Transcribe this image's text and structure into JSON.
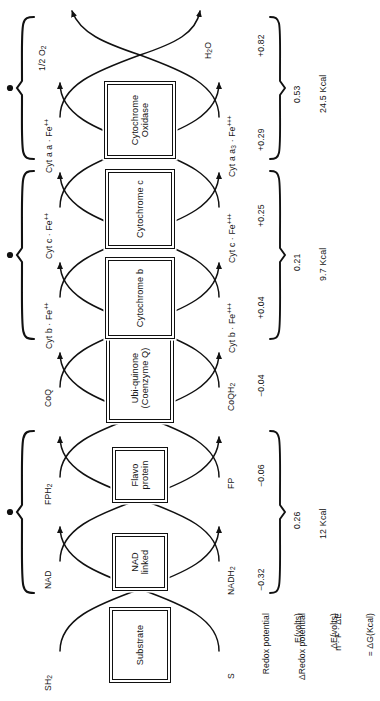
{
  "figure": {
    "orientation": "rotated-90-ccw"
  },
  "carriers": [
    {
      "id": "substrate",
      "line1": "Substrate",
      "line2": ""
    },
    {
      "id": "nad",
      "line1": "NAD",
      "line2": "linked"
    },
    {
      "id": "flavoprotein",
      "line1": "Flavo",
      "line2": "protein"
    },
    {
      "id": "ubiquinone",
      "line1": "Ubi-quinone",
      "line2": "(Coenzyme Q)"
    },
    {
      "id": "cyt-b",
      "line1": "Cytochrome b",
      "line2": ""
    },
    {
      "id": "cyt-c",
      "line1": "Cytochrome c",
      "line2": ""
    },
    {
      "id": "cyt-oxidase",
      "line1": "Cytochrome",
      "line2": "Oxidase"
    }
  ],
  "reduced_labels": [
    {
      "id": "sh2",
      "text": "SH2"
    },
    {
      "id": "nad-ox",
      "text": "NAD"
    },
    {
      "id": "fph2",
      "text": "FPH2"
    },
    {
      "id": "coq",
      "text": "CoQ"
    },
    {
      "id": "cyt-b-fe2",
      "text": "Cyt b · Fe++"
    },
    {
      "id": "cyt-c-fe2",
      "text": "Cyt c · Fe++"
    },
    {
      "id": "cyt-aa-fe2",
      "text": "Cyt a a · Fe++"
    },
    {
      "id": "half-o2",
      "text": "1/2 O2"
    }
  ],
  "oxidized_labels": [
    {
      "id": "s",
      "text": "S"
    },
    {
      "id": "nadh2",
      "text": "NADH2"
    },
    {
      "id": "fp",
      "text": "FP"
    },
    {
      "id": "coqh2",
      "text": "CoQH2"
    },
    {
      "id": "cyt-b-fe3",
      "text": "Cyt b · Fe+++"
    },
    {
      "id": "cyt-c-fe3",
      "text": "Cyt c · Fe+++"
    },
    {
      "id": "cyt-aa3-fe3",
      "text": "Cyt a a3 · Fe+++"
    },
    {
      "id": "h2o",
      "text": "H2O"
    }
  ],
  "atp_couplings": [
    {
      "id": "site-1",
      "text": "ADP + Pi → ATP"
    },
    {
      "id": "site-2",
      "text": "ADP + Pi → ATP"
    },
    {
      "id": "site-3",
      "text": "ADP + Pi → ATP"
    }
  ],
  "redox_potentials": [
    {
      "id": "e-nad",
      "value": "−0.32"
    },
    {
      "id": "e-fp",
      "value": "−0.06"
    },
    {
      "id": "e-coq",
      "value": "−0.04"
    },
    {
      "id": "e-cytb",
      "value": "+0.04"
    },
    {
      "id": "e-cytc",
      "value": "+0.25"
    },
    {
      "id": "e-cytaa",
      "value": "+0.29"
    },
    {
      "id": "e-o2",
      "value": "+0.82"
    }
  ],
  "delta_e": [
    {
      "id": "de-site1",
      "value": "0.26"
    },
    {
      "id": "de-site2",
      "value": "0.21"
    },
    {
      "id": "de-site3",
      "value": "0.53"
    }
  ],
  "free_energy": [
    {
      "id": "dg-site1",
      "value": "12 Kcal"
    },
    {
      "id": "dg-site2",
      "value": "9.7 Kcal"
    },
    {
      "id": "dg-site3",
      "value": "24.5 Kcal"
    }
  ],
  "legend_rows": [
    {
      "id": "row-e",
      "line1": "Redox potential",
      "line2": "E(volts)"
    },
    {
      "id": "row-de",
      "line1": "ΔRedox potential",
      "line2": "ΔE(volts)"
    },
    {
      "id": "row-dg",
      "line1": "n · F · ΔE",
      "line2": "= ΔG(Kcal)"
    }
  ],
  "colors": {
    "ink": "#151515",
    "paper": "#ffffff"
  }
}
